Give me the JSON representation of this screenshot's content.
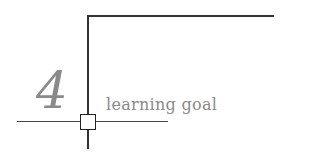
{
  "section": {
    "number": "4",
    "label": "learning goal"
  },
  "colors": {
    "line": "#333333",
    "text": "#8a8a8a"
  }
}
